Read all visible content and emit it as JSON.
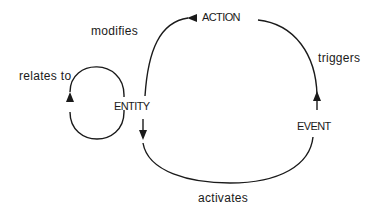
{
  "diagram": {
    "nodes": {
      "entity": "ENTITY",
      "action": "ACTION",
      "event": "EVENT"
    },
    "edges": {
      "relates_to": "relates to",
      "modifies": "modifies",
      "triggers": "triggers",
      "activates": "activates"
    },
    "colors": {
      "stroke": "#1a1a1a",
      "background": "#ffffff"
    }
  }
}
